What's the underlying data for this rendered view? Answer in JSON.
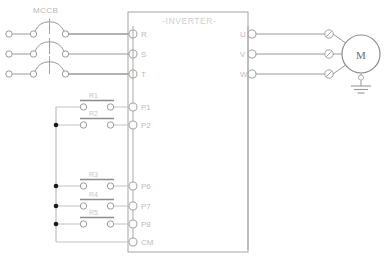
{
  "diagram": {
    "breaker_label": "MCCB",
    "inverter_label": "-INVERTER-",
    "motor_label": "M",
    "input_terminals": [
      "R",
      "S",
      "T"
    ],
    "output_terminals": [
      "U",
      "V",
      "W"
    ],
    "control_terminals": [
      "P1",
      "P2",
      "P6",
      "P7",
      "P8",
      "CM"
    ],
    "relay_labels": [
      "R1",
      "R2",
      "R3",
      "R4",
      "R5"
    ],
    "colors": {
      "wire": "#9a9a9a",
      "wire_light": "#c3c3c3",
      "box": "#b5b5b5",
      "text": "#bdbdbd",
      "motor_text": "#6e6e6e",
      "junction": "#1a1a1a",
      "background": "#ffffff"
    }
  }
}
